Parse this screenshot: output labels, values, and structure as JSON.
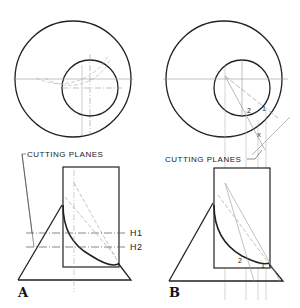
{
  "figure": {
    "panels": [
      {
        "id": "A",
        "label": "A",
        "cutting_planes_label": "CUTTING PLANES",
        "plane_labels": [
          "H1",
          "H2"
        ]
      },
      {
        "id": "B",
        "label": "B",
        "cutting_planes_label": "CUTTING PLANES",
        "point_labels": [
          "1",
          "2",
          "1",
          "2",
          "X"
        ]
      }
    ],
    "colors": {
      "line": "#222222",
      "construction": "#999999"
    }
  }
}
